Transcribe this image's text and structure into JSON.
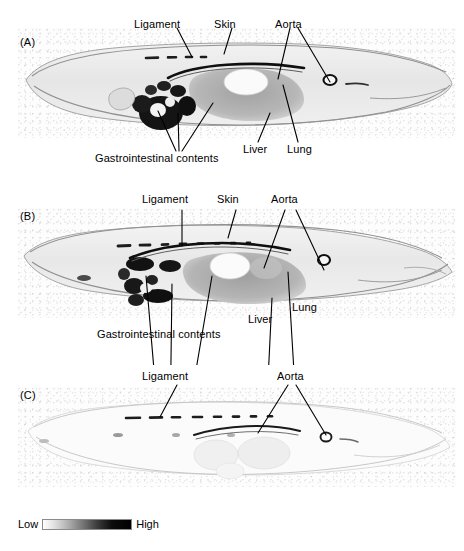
{
  "figure": {
    "type": "whole-body-autoradiograph-figure",
    "panels": [
      {
        "id": "A",
        "label": "(A)",
        "annotations": [
          {
            "key": "ligament",
            "label": "Ligament"
          },
          {
            "key": "skin",
            "label": "Skin"
          },
          {
            "key": "aorta",
            "label": "Aorta"
          },
          {
            "key": "gi",
            "label": "Gastrointestinal contents"
          },
          {
            "key": "liver",
            "label": "Liver"
          },
          {
            "key": "lung",
            "label": "Lung"
          }
        ]
      },
      {
        "id": "B",
        "label": "(B)",
        "annotations": [
          {
            "key": "ligament",
            "label": "Ligament"
          },
          {
            "key": "skin",
            "label": "Skin"
          },
          {
            "key": "aorta",
            "label": "Aorta"
          },
          {
            "key": "gi",
            "label": "Gastrointestinal contents"
          },
          {
            "key": "liver",
            "label": "Liver"
          },
          {
            "key": "lung",
            "label": "Lung"
          }
        ]
      },
      {
        "id": "C",
        "label": "(C)",
        "annotations": [
          {
            "key": "ligament",
            "label": "Ligament"
          },
          {
            "key": "aorta",
            "label": "Aorta"
          }
        ]
      }
    ]
  },
  "scalebar": {
    "low_label": "Low",
    "high_label": "High",
    "low_color": "#ffffff",
    "high_color": "#000000",
    "orientation": "horizontal"
  },
  "colors": {
    "text": "#000000",
    "film_background": "#fdfdfd",
    "tissue_light": "#e2e2e2",
    "tissue_mid": "#b0b0b0",
    "tissue_dark": "#6a6a6a",
    "hot_spot": "#1a1a1a",
    "leader_line": "#000000"
  }
}
